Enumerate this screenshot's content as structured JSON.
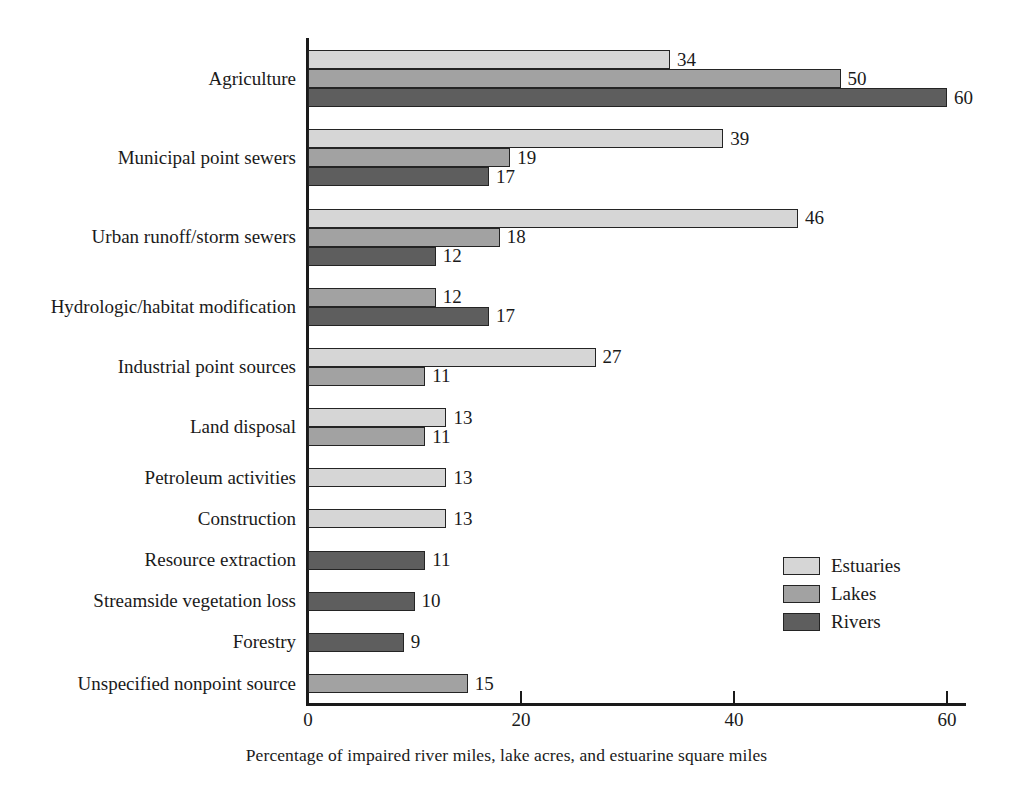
{
  "chart_data": {
    "type": "bar",
    "orientation": "horizontal",
    "grouped": true,
    "title": "",
    "xlabel": "Percentage of impaired river miles, lake acres, and estuarine square miles",
    "ylabel": "",
    "xlim": [
      0,
      65
    ],
    "xticks": [
      0,
      20,
      40,
      60
    ],
    "xtick_labels": [
      "0",
      "20",
      "40",
      "60"
    ],
    "grid": false,
    "legend_position": "lower-right",
    "categories": [
      "Agriculture",
      "Municipal point sewers",
      "Urban runoff/storm sewers",
      "Hydrologic/habitat modification",
      "Industrial point sources",
      "Land disposal",
      "Petroleum activities",
      "Construction",
      "Resource extraction",
      "Streamside vegetation loss",
      "Forestry",
      "Unspecified nonpoint source"
    ],
    "series": [
      {
        "name": "Estuaries",
        "color": "#d6d6d6",
        "values": [
          34,
          39,
          46,
          null,
          27,
          13,
          13,
          13,
          null,
          null,
          null,
          null
        ]
      },
      {
        "name": "Lakes",
        "color": "#a2a2a2",
        "values": [
          50,
          19,
          18,
          12,
          11,
          11,
          null,
          null,
          null,
          null,
          null,
          15
        ]
      },
      {
        "name": "Rivers",
        "color": "#5e5e5e",
        "values": [
          60,
          17,
          12,
          17,
          null,
          null,
          null,
          null,
          11,
          10,
          9,
          null
        ]
      }
    ],
    "legend": [
      {
        "label": "Estuaries",
        "color": "#d6d6d6"
      },
      {
        "label": "Lakes",
        "color": "#a2a2a2"
      },
      {
        "label": "Rivers",
        "color": "#5e5e5e"
      }
    ]
  }
}
